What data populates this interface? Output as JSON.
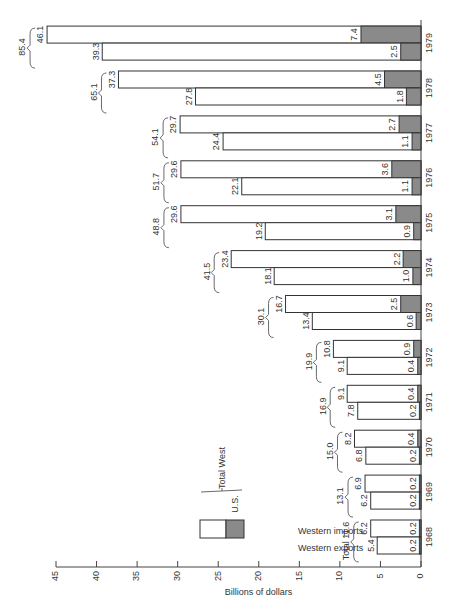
{
  "chart_data": {
    "type": "bar",
    "orientation": "rotated-90-ccw (values extend leftward from baseline at right)",
    "stacked": true,
    "title": "",
    "xlabel": "",
    "ylabel": "Billions of dollars",
    "ylim": [
      0,
      45
    ],
    "yticks": [
      0,
      5,
      10,
      15,
      20,
      25,
      30,
      35,
      40,
      45
    ],
    "grid": false,
    "categories": [
      "1968",
      "1969",
      "1970",
      "1971",
      "1972",
      "1973",
      "1974",
      "1975",
      "1976",
      "1977",
      "1978",
      "1979"
    ],
    "series": [
      {
        "name": "Western exports",
        "total_west": [
          5.4,
          6.2,
          6.8,
          7.8,
          9.1,
          13.4,
          18.1,
          19.2,
          22.1,
          24.4,
          27.8,
          39.3
        ],
        "us": [
          0.2,
          0.2,
          0.2,
          0.2,
          0.4,
          0.6,
          1.0,
          0.9,
          1.1,
          1.1,
          1.8,
          2.5
        ]
      },
      {
        "name": "Western imports",
        "total_west": [
          6.2,
          6.9,
          8.2,
          9.1,
          10.8,
          16.7,
          23.4,
          29.6,
          29.6,
          29.7,
          37.3,
          46.1
        ],
        "us": [
          0.2,
          0.2,
          0.4,
          0.4,
          0.9,
          2.5,
          2.2,
          3.1,
          3.6,
          2.7,
          4.5,
          7.4
        ]
      }
    ],
    "group_totals": [
      11.6,
      13.1,
      15.0,
      16.9,
      19.9,
      30.1,
      41.5,
      48.8,
      51.7,
      54.1,
      65.1,
      85.4
    ],
    "first_total_prefix": "Total",
    "legend": {
      "entries": [
        {
          "label": "Total West",
          "fill": "#ffffff"
        },
        {
          "label": "U.S.",
          "fill": "#8c8c8c"
        }
      ],
      "position": "lower-middle"
    },
    "annotations": [
      "Western imports",
      "Western exports"
    ]
  },
  "colors": {
    "total_west": "#ffffff",
    "us": "#8a8a8a",
    "stroke": "#333333"
  }
}
